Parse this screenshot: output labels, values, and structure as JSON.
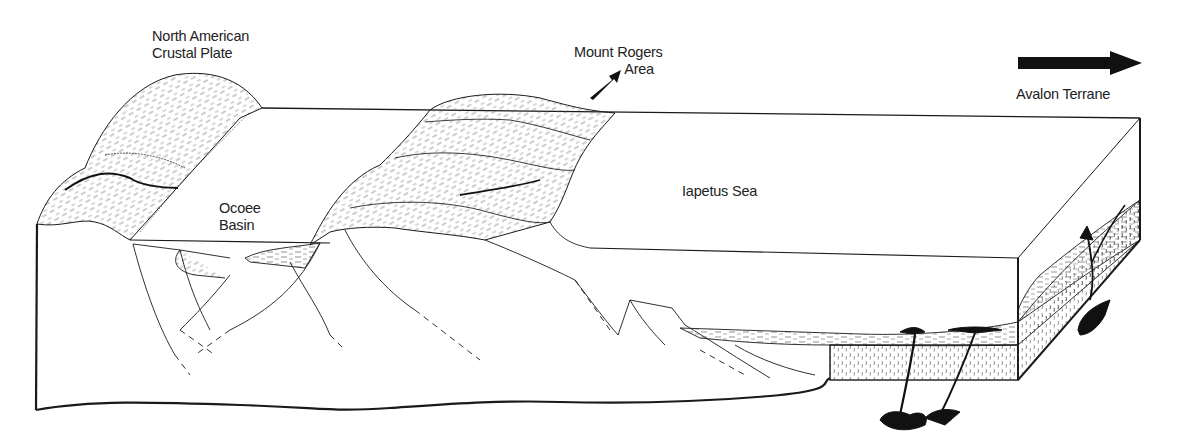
{
  "figure": {
    "type": "geologic block diagram",
    "background": "#ffffff",
    "ink": "#1a1a1a"
  },
  "labels": {
    "north_american_plate": [
      "North American",
      "Crustal Plate"
    ],
    "ocoee_basin": [
      "Ocoee",
      "Basin"
    ],
    "mount_rogers": [
      "Mount Rogers",
      "Area"
    ],
    "iapetus_sea": "Iapetus Sea",
    "avalon_terrane": "Avalon Terrane"
  },
  "arrows": {
    "mount_rogers_arrow": {
      "direction": "up-right",
      "icon": "arrow-up-right-icon"
    },
    "avalon_arrow": {
      "direction": "right",
      "icon": "arrow-right-icon"
    }
  }
}
